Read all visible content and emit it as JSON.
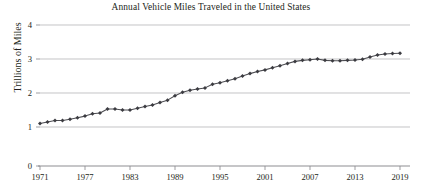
{
  "chart_data": {
    "type": "line",
    "title": "Annual Vehicle Miles Traveled in the United States",
    "xlabel": "",
    "ylabel": "Trillions of Miles",
    "ylim": [
      0,
      4
    ],
    "xlim": [
      1971,
      2019
    ],
    "grid": true,
    "legend": "none",
    "axis_break": {
      "between": [
        0,
        1
      ],
      "note": "vertical axis is broken: the 0-to-1 interval is drawn taller than the other unit intervals"
    },
    "ytick_labels": [
      "0",
      "1",
      "2",
      "3",
      "4"
    ],
    "ytick_values": [
      0,
      1,
      2,
      3,
      4
    ],
    "xtick_labels": [
      "1971",
      "1977",
      "1983",
      "1989",
      "1995",
      "2001",
      "2007",
      "2013",
      "2019"
    ],
    "xtick_values": [
      1971,
      1977,
      1983,
      1989,
      1995,
      2001,
      2007,
      2013,
      2019
    ],
    "marker": "diamond",
    "line_color": "#4d4d52",
    "marker_color": "#3b3b40",
    "gridline_color": "#b9b9bc",
    "axis_color": "#8d8d91",
    "x": [
      1971,
      1972,
      1973,
      1974,
      1975,
      1976,
      1977,
      1978,
      1979,
      1980,
      1981,
      1982,
      1983,
      1984,
      1985,
      1986,
      1987,
      1988,
      1989,
      1990,
      1991,
      1992,
      1993,
      1994,
      1995,
      1996,
      1997,
      1998,
      1999,
      2000,
      2001,
      2002,
      2003,
      2004,
      2005,
      2006,
      2007,
      2008,
      2009,
      2010,
      2011,
      2012,
      2013,
      2014,
      2015,
      2016,
      2017,
      2018,
      2019
    ],
    "values": [
      1.1,
      1.15,
      1.19,
      1.19,
      1.23,
      1.27,
      1.32,
      1.39,
      1.41,
      1.53,
      1.53,
      1.5,
      1.5,
      1.55,
      1.6,
      1.65,
      1.72,
      1.79,
      1.92,
      2.02,
      2.08,
      2.12,
      2.15,
      2.26,
      2.3,
      2.36,
      2.42,
      2.5,
      2.57,
      2.63,
      2.68,
      2.74,
      2.8,
      2.87,
      2.93,
      2.96,
      2.98,
      3.0,
      2.96,
      2.95,
      2.95,
      2.96,
      2.97,
      2.99,
      3.06,
      3.12,
      3.15,
      3.16,
      3.17
    ],
    "series": [
      {
        "name": "Annual Vehicle Miles Traveled",
        "units": "Trillions of Miles",
        "values": [
          1.1,
          1.15,
          1.19,
          1.19,
          1.23,
          1.27,
          1.32,
          1.39,
          1.41,
          1.53,
          1.53,
          1.5,
          1.5,
          1.55,
          1.6,
          1.65,
          1.72,
          1.79,
          1.92,
          2.02,
          2.08,
          2.12,
          2.15,
          2.26,
          2.3,
          2.36,
          2.42,
          2.5,
          2.57,
          2.63,
          2.68,
          2.74,
          2.8,
          2.87,
          2.93,
          2.96,
          2.98,
          3.0,
          2.96,
          2.95,
          2.95,
          2.96,
          2.97,
          2.99,
          3.06,
          3.12,
          3.15,
          3.16,
          3.17
        ]
      }
    ]
  },
  "source_note": ""
}
